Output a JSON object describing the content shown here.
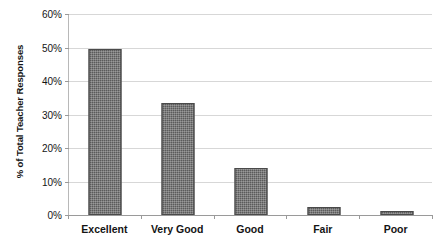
{
  "chart_data": {
    "type": "bar",
    "title": "",
    "xlabel": "",
    "ylabel": "% of Total Teacher Responses",
    "categories": [
      "Excellent",
      "Very Good",
      "Good",
      "Fair",
      "Poor"
    ],
    "values": [
      49.5,
      33.5,
      14.0,
      2.3,
      1.2
    ],
    "value_labels": [
      "49.5%",
      "33.5%",
      "14.0%",
      "2.3%",
      "1.2%"
    ],
    "ylim": [
      0,
      60
    ],
    "ytick_values": [
      0,
      10,
      20,
      30,
      40,
      50,
      60
    ],
    "ytick_labels": [
      "0%",
      "10%",
      "20%",
      "30%",
      "40%",
      "50%",
      "60%"
    ],
    "grid": true,
    "legend": false,
    "legend_position": "none",
    "series": [
      {
        "name": "% of Total Teacher Responses",
        "values": [
          49.5,
          33.5,
          14.0,
          2.3,
          1.2
        ]
      }
    ],
    "colors": {
      "bar_fill": "#5b5b5b",
      "bar_edge": "#4a4a4a",
      "gridline": "#d7d7d7",
      "axis_line": "#9a9a9a",
      "background": "#ffffff",
      "text": "#141414"
    }
  },
  "axes": {
    "y_title": "% of Total Teacher Responses",
    "y_ticks": [
      {
        "label": "60%",
        "value": 60
      },
      {
        "label": "50%",
        "value": 50
      },
      {
        "label": "40%",
        "value": 40
      },
      {
        "label": "30%",
        "value": 30
      },
      {
        "label": "20%",
        "value": 20
      },
      {
        "label": "10%",
        "value": 10
      },
      {
        "label": "0%",
        "value": 0
      }
    ],
    "x_categories": [
      {
        "label": "Excellent"
      },
      {
        "label": "Very Good"
      },
      {
        "label": "Good"
      },
      {
        "label": "Fair"
      },
      {
        "label": "Poor"
      }
    ]
  },
  "title_remnant": ""
}
